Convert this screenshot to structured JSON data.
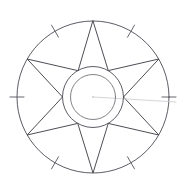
{
  "figure": {
    "background_color": "#ffffff",
    "width": 184,
    "height": 188,
    "center": {
      "x": 93,
      "y": 97
    },
    "stroke_color": "#4a4a52",
    "faint_stroke_color": "#c9c9cf",
    "inner_stroke_color": "#6b6b73"
  },
  "outer_circle": {
    "label": "outer rim circle",
    "cx": 93,
    "cy": 97,
    "r": 76,
    "stroke": "#4a4a52",
    "stroke_width": 0.9
  },
  "hub_circles": [
    {
      "label": "hub outer circle",
      "cx": 93,
      "cy": 97,
      "r": 30.5,
      "stroke": "#4a4a52",
      "stroke_width": 0.9
    },
    {
      "label": "hub inner circle",
      "cx": 93,
      "cy": 97,
      "r": 22.5,
      "stroke": "#6b6b73",
      "stroke_width": 0.85
    }
  ],
  "star": {
    "label": "six pointed star",
    "points": 6,
    "outer_radius": 76,
    "inner_radius": 30.5,
    "tip_angles_deg": [
      90,
      30,
      330,
      270,
      210,
      150
    ],
    "valley_angles_deg": [
      60,
      0,
      300,
      240,
      180,
      120
    ],
    "stroke": "#43434b",
    "stroke_width": 0.95,
    "tips": [
      {
        "name": "tip-top",
        "angle_deg": 90,
        "x": 93,
        "y": 21
      },
      {
        "name": "tip-upper-right",
        "angle_deg": 30,
        "x": 159,
        "y": 59
      },
      {
        "name": "tip-lower-right",
        "angle_deg": 330,
        "x": 159,
        "y": 135
      },
      {
        "name": "tip-bottom",
        "angle_deg": 270,
        "x": 93,
        "y": 173
      },
      {
        "name": "tip-lower-left",
        "angle_deg": 210,
        "x": 27,
        "y": 135
      },
      {
        "name": "tip-upper-left",
        "angle_deg": 150,
        "x": 27,
        "y": 59
      }
    ]
  },
  "ticks": {
    "label": "rim tick marks",
    "count": 6,
    "angles_deg": [
      0,
      60,
      120,
      180,
      240,
      300
    ],
    "inner_offset": -7,
    "outer_offset": 7,
    "stroke": "#55555d",
    "stroke_width": 0.9
  },
  "faint_line": {
    "label": "faint guide line",
    "x1": 93,
    "y1": 97,
    "x2": 176,
    "y2": 102,
    "stroke": "#c9c9cf"
  },
  "center_dot": {
    "label": "center mark",
    "cx": 93,
    "cy": 97,
    "r": 0.8,
    "fill": "#b9b9c0"
  }
}
